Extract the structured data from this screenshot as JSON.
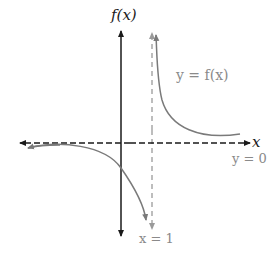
{
  "diagram": {
    "type": "function-graph",
    "y_axis_label": "f(x)",
    "x_axis_label": "x",
    "curve_label": "y = f(x)",
    "horizontal_asymptote_label": "y = 0",
    "vertical_asymptote_label": "x = 1",
    "colors": {
      "axes": "#1a1a1a",
      "curve": "#7a7a7a",
      "asymptote_vertical": "#9a9a9a",
      "asymptote_horizontal": "#1a1a1a",
      "labels_gray": "#8a8a8a"
    }
  }
}
